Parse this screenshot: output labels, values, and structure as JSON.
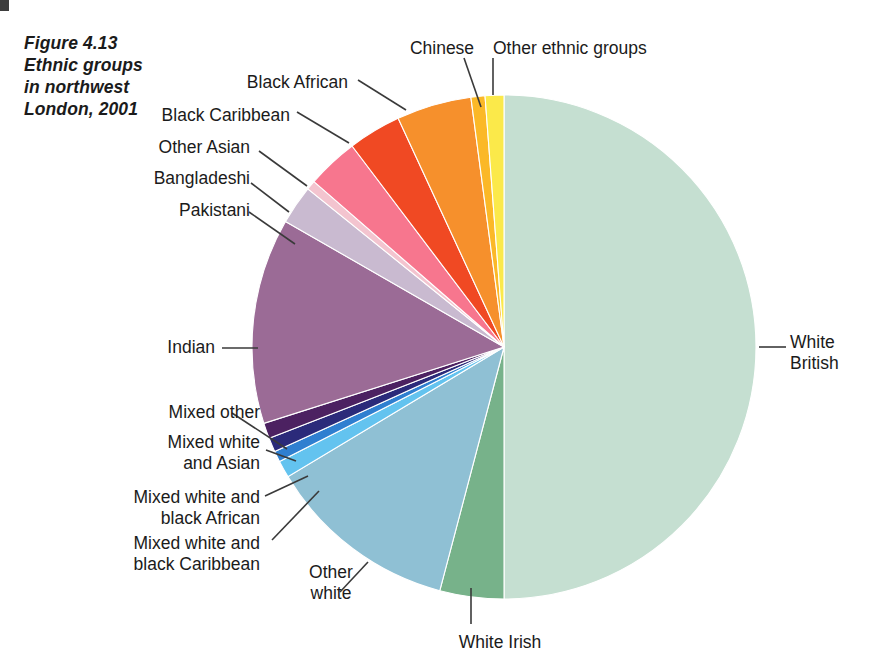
{
  "figure": {
    "title": "Figure 4.13\nEthnic groups\nin northwest\nLondon, 2001",
    "background_color": "#ffffff",
    "text_color": "#1b1b1b"
  },
  "chart_data": {
    "type": "pie",
    "title": "Figure 4.13 Ethnic groups in northwest London, 2001",
    "xlabel": "",
    "ylabel": "",
    "units": "percent of population",
    "start_angle_deg": 0,
    "direction": "clockwise",
    "legend_position": "callout-labels",
    "grid": false,
    "categories": [
      "White British",
      "White Irish",
      "Other white",
      "Mixed white and black Caribbean",
      "Mixed white and black African",
      "Mixed white and Asian",
      "Mixed other",
      "Indian",
      "Pakistani",
      "Bangladeshi",
      "Other Asian",
      "Black Caribbean",
      "Black African",
      "Chinese",
      "Other ethnic groups"
    ],
    "values": [
      50.0,
      4.1,
      12.3,
      1.1,
      0.7,
      0.9,
      1.0,
      13.2,
      2.5,
      0.6,
      3.3,
      3.4,
      4.8,
      0.9,
      1.2
    ],
    "colors": [
      "#c5dfd1",
      "#77b28a",
      "#8fc0d4",
      "#63c3ef",
      "#2f7fd0",
      "#2b2a7a",
      "#4c2161",
      "#9b6b96",
      "#c9bad0",
      "#f3c4cf",
      "#f7768e",
      "#f04923",
      "#f6902c",
      "#fbb827",
      "#fbe94a"
    ],
    "slices": [
      {
        "label": "White British",
        "value": 50.0,
        "color": "#c5dfd1"
      },
      {
        "label": "White Irish",
        "value": 4.1,
        "color": "#77b28a"
      },
      {
        "label": "Other white",
        "value": 12.3,
        "color": "#8fc0d4"
      },
      {
        "label": "Mixed white and black Caribbean",
        "value": 1.1,
        "color": "#63c3ef"
      },
      {
        "label": "Mixed white and black African",
        "value": 0.7,
        "color": "#2f7fd0"
      },
      {
        "label": "Mixed white and Asian",
        "value": 0.9,
        "color": "#2b2a7a"
      },
      {
        "label": "Mixed other",
        "value": 1.0,
        "color": "#4c2161"
      },
      {
        "label": "Indian",
        "value": 13.2,
        "color": "#9b6b96"
      },
      {
        "label": "Pakistani",
        "value": 2.5,
        "color": "#c9bad0"
      },
      {
        "label": "Bangladeshi",
        "value": 0.6,
        "color": "#f3c4cf"
      },
      {
        "label": "Other Asian",
        "value": 3.3,
        "color": "#f7768e"
      },
      {
        "label": "Black Caribbean",
        "value": 3.4,
        "color": "#f04923"
      },
      {
        "label": "Black African",
        "value": 4.8,
        "color": "#f6902c"
      },
      {
        "label": "Chinese",
        "value": 0.9,
        "color": "#fbb827"
      },
      {
        "label": "Other ethnic groups",
        "value": 1.2,
        "color": "#fbe94a"
      }
    ]
  },
  "labels": [
    {
      "name": "label-white-british",
      "text": "White\nBritish",
      "x": 790,
      "y": 332,
      "align": "left",
      "width": 90
    },
    {
      "name": "label-white-irish",
      "text": "White Irish",
      "x": 435,
      "y": 632,
      "align": "center",
      "width": 130
    },
    {
      "name": "label-other-white",
      "text": "Other\nwhite",
      "x": 286,
      "y": 562,
      "align": "center",
      "width": 90
    },
    {
      "name": "label-mixed-white-black-caribbean",
      "text": "Mixed white and\nblack Caribbean",
      "x": 10,
      "y": 533,
      "align": "right",
      "width": 250
    },
    {
      "name": "label-mixed-white-black-african",
      "text": "Mixed white and\nblack African",
      "x": 10,
      "y": 487,
      "align": "right",
      "width": 250
    },
    {
      "name": "label-mixed-white-asian",
      "text": "Mixed white\nand Asian",
      "x": 60,
      "y": 432,
      "align": "right",
      "width": 200
    },
    {
      "name": "label-mixed-other",
      "text": "Mixed other",
      "x": 60,
      "y": 402,
      "align": "right",
      "width": 200
    },
    {
      "name": "label-indian",
      "text": "Indian",
      "x": 60,
      "y": 337,
      "align": "right",
      "width": 155
    },
    {
      "name": "label-pakistani",
      "text": "Pakistani",
      "x": 60,
      "y": 200,
      "align": "right",
      "width": 190
    },
    {
      "name": "label-bangladeshi",
      "text": "Bangladeshi",
      "x": 60,
      "y": 168,
      "align": "right",
      "width": 190
    },
    {
      "name": "label-other-asian",
      "text": "Other Asian",
      "x": 60,
      "y": 137,
      "align": "right",
      "width": 190
    },
    {
      "name": "label-black-caribbean",
      "text": "Black Caribbean",
      "x": 60,
      "y": 105,
      "align": "right",
      "width": 230
    },
    {
      "name": "label-black-african",
      "text": "Black African",
      "x": 118,
      "y": 72,
      "align": "right",
      "width": 230
    },
    {
      "name": "label-chinese",
      "text": "Chinese",
      "x": 392,
      "y": 38,
      "align": "center",
      "width": 100
    },
    {
      "name": "label-other-ethnic-groups",
      "text": "Other ethnic groups",
      "x": 493,
      "y": 38,
      "align": "left",
      "width": 220
    }
  ],
  "leader_lines": [
    {
      "name": "leader-white-british",
      "x1": 759,
      "y1": 347,
      "x2": 786,
      "y2": 347
    },
    {
      "name": "leader-white-irish",
      "x1": 471,
      "y1": 588,
      "x2": 471,
      "y2": 624
    },
    {
      "name": "leader-other-white",
      "x1": 368,
      "y1": 562,
      "x2": 340,
      "y2": 592
    },
    {
      "name": "leader-mixed-white-black-caribbean",
      "x1": 319,
      "y1": 491,
      "x2": 272,
      "y2": 540
    },
    {
      "name": "leader-mixed-white-black-african",
      "x1": 308,
      "y1": 476,
      "x2": 265,
      "y2": 496
    },
    {
      "name": "leader-mixed-white-asian",
      "x1": 296,
      "y1": 461,
      "x2": 266,
      "y2": 450
    },
    {
      "name": "leader-mixed-other",
      "x1": 287,
      "y1": 449,
      "x2": 232,
      "y2": 413
    },
    {
      "name": "leader-indian",
      "x1": 258,
      "y1": 348,
      "x2": 222,
      "y2": 348
    },
    {
      "name": "leader-pakistani",
      "x1": 295,
      "y1": 244,
      "x2": 249,
      "y2": 212
    },
    {
      "name": "leader-bangladeshi",
      "x1": 289,
      "y1": 212,
      "x2": 251,
      "y2": 183
    },
    {
      "name": "leader-other-asian",
      "x1": 307,
      "y1": 186,
      "x2": 259,
      "y2": 151
    },
    {
      "name": "leader-black-caribbean",
      "x1": 349,
      "y1": 143,
      "x2": 297,
      "y2": 112
    },
    {
      "name": "leader-black-african",
      "x1": 406,
      "y1": 110,
      "x2": 358,
      "y2": 80
    },
    {
      "name": "leader-chinese",
      "x1": 481,
      "y1": 107,
      "x2": 464,
      "y2": 58
    },
    {
      "name": "leader-other-ethnic-groups",
      "x1": 493,
      "y1": 95,
      "x2": 493,
      "y2": 58
    }
  ]
}
